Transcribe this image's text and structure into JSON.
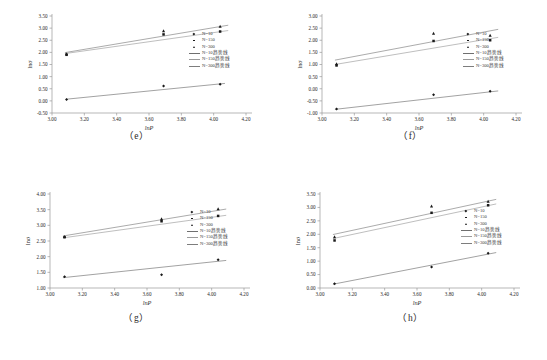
{
  "figure": {
    "background": "#ffffff",
    "axis_color": "#8c8c8c",
    "text_color": "#2b2b2b"
  },
  "legend": {
    "items": [
      {
        "label": "N=10",
        "type": "marker",
        "marker": "diamond",
        "color": "#1a1a1a"
      },
      {
        "label": "N=150",
        "type": "marker",
        "marker": "square",
        "color": "#1a1a1a"
      },
      {
        "label": "N=300",
        "type": "marker",
        "marker": "triangle",
        "color": "#1a1a1a"
      },
      {
        "label": "N=10趋势线",
        "type": "line",
        "color": "#6f6f6f"
      },
      {
        "label": "N=150趋势线",
        "type": "line",
        "color": "#9a9a9a"
      },
      {
        "label": "N=300趋势线",
        "type": "line",
        "color": "#7d7d7d"
      }
    ]
  },
  "chart_data": [
    {
      "id": "e",
      "caption": "（e）",
      "type": "scatter",
      "title": "",
      "xlabel": "lnP",
      "ylabel": "lnσ",
      "xlim": [
        3.0,
        4.2
      ],
      "ylim": [
        -0.5,
        3.5
      ],
      "xticks": [
        "3.00",
        "3.20",
        "3.40",
        "3.60",
        "3.80",
        "4.00",
        "4.20"
      ],
      "yticks": [
        "-0.50",
        "0.00",
        "0.50",
        "1.00",
        "1.50",
        "2.00",
        "2.50",
        "3.00",
        "3.50"
      ],
      "grid": false,
      "legend_position": "right",
      "x": [
        3.09,
        3.69,
        4.04
      ],
      "series": [
        {
          "name": "N=10",
          "marker": "diamond",
          "values": [
            0.06,
            0.61,
            0.69
          ]
        },
        {
          "name": "N=150",
          "marker": "square",
          "values": [
            1.9,
            2.74,
            2.86
          ]
        },
        {
          "name": "N=300",
          "marker": "triangle",
          "values": [
            1.93,
            2.88,
            3.07
          ]
        }
      ],
      "trendlines": [
        {
          "name": "N=10趋势线",
          "color": "#6f6f6f",
          "x0": 3.09,
          "y0": 0.07,
          "x1": 4.07,
          "y1": 0.72
        },
        {
          "name": "N=150趋势线",
          "color": "#9a9a9a",
          "x0": 3.08,
          "y0": 1.95,
          "x1": 4.09,
          "y1": 2.9
        },
        {
          "name": "N=300趋势线",
          "color": "#7d7d7d",
          "x0": 3.08,
          "y0": 1.99,
          "x1": 4.09,
          "y1": 3.12
        }
      ]
    },
    {
      "id": "f",
      "caption": "（f）",
      "type": "scatter",
      "title": "",
      "xlabel": "lnP",
      "ylabel": "lnσ",
      "xlim": [
        3.0,
        4.2
      ],
      "ylim": [
        -1.0,
        3.0
      ],
      "xticks": [
        "3.00",
        "3.20",
        "3.40",
        "3.60",
        "3.80",
        "4.00",
        "4.20"
      ],
      "yticks": [
        "-1.00",
        "-0.50",
        "0.00",
        "0.50",
        "1.00",
        "1.50",
        "2.00",
        "2.50",
        "3.00"
      ],
      "grid": false,
      "legend_position": "right",
      "x": [
        3.09,
        3.69,
        4.04
      ],
      "series": [
        {
          "name": "N=10",
          "marker": "diamond",
          "values": [
            -0.84,
            -0.25,
            -0.1
          ]
        },
        {
          "name": "N=150",
          "marker": "square",
          "values": [
            0.96,
            1.97,
            2.0
          ]
        },
        {
          "name": "N=300",
          "marker": "triangle",
          "values": [
            1.02,
            2.28,
            2.2
          ]
        }
      ],
      "trendlines": [
        {
          "name": "N=10趋势线",
          "color": "#6f6f6f",
          "x0": 3.08,
          "y0": -0.85,
          "x1": 4.09,
          "y1": -0.09
        },
        {
          "name": "N=150趋势线",
          "color": "#9a9a9a",
          "x0": 3.08,
          "y0": 1.0,
          "x1": 4.09,
          "y1": 2.12
        },
        {
          "name": "N=300趋势线",
          "color": "#7d7d7d",
          "x0": 3.08,
          "y0": 1.18,
          "x1": 4.09,
          "y1": 2.45
        }
      ]
    },
    {
      "id": "g",
      "caption": "（g）",
      "type": "scatter",
      "title": "",
      "xlabel": "lnP",
      "ylabel": "lnσ",
      "xlim": [
        3.0,
        4.2
      ],
      "ylim": [
        1.0,
        4.0
      ],
      "xticks": [
        "3.00",
        "3.20",
        "3.40",
        "3.60",
        "3.80",
        "4.00",
        "4.20"
      ],
      "yticks": [
        "1.00",
        "1.50",
        "2.00",
        "2.50",
        "3.00",
        "3.50",
        "4.00"
      ],
      "grid": false,
      "legend_position": "right",
      "x": [
        3.09,
        3.69,
        4.04
      ],
      "series": [
        {
          "name": "N=10",
          "marker": "diamond",
          "values": [
            1.36,
            1.42,
            1.9
          ]
        },
        {
          "name": "N=150",
          "marker": "square",
          "values": [
            2.62,
            3.13,
            3.3
          ]
        },
        {
          "name": "N=300",
          "marker": "triangle",
          "values": [
            2.64,
            3.2,
            3.52
          ]
        }
      ],
      "trendlines": [
        {
          "name": "N=10趋势线",
          "color": "#6f6f6f",
          "x0": 3.08,
          "y0": 1.33,
          "x1": 4.09,
          "y1": 1.88
        },
        {
          "name": "N=150趋势线",
          "color": "#9a9a9a",
          "x0": 3.08,
          "y0": 2.6,
          "x1": 4.09,
          "y1": 3.32
        },
        {
          "name": "N=300趋势线",
          "color": "#7d7d7d",
          "x0": 3.08,
          "y0": 2.66,
          "x1": 4.09,
          "y1": 3.52
        }
      ]
    },
    {
      "id": "h",
      "caption": "（h）",
      "type": "scatter",
      "title": "",
      "xlabel": "lnP",
      "ylabel": "lnσ",
      "xlim": [
        3.0,
        4.2
      ],
      "ylim": [
        0.0,
        3.5
      ],
      "xticks": [
        "3.00",
        "3.20",
        "3.40",
        "3.60",
        "3.80",
        "4.00",
        "4.20"
      ],
      "yticks": [
        "0.00",
        "0.50",
        "1.00",
        "1.50",
        "2.00",
        "2.50",
        "3.00",
        "3.50"
      ],
      "grid": false,
      "legend_position": "right",
      "x": [
        3.09,
        3.69,
        4.04
      ],
      "series": [
        {
          "name": "N=10",
          "marker": "diamond",
          "values": [
            0.16,
            0.78,
            1.29
          ]
        },
        {
          "name": "N=150",
          "marker": "square",
          "values": [
            1.77,
            2.8,
            3.08
          ]
        },
        {
          "name": "N=300",
          "marker": "triangle",
          "values": [
            1.9,
            3.05,
            3.22
          ]
        }
      ],
      "trendlines": [
        {
          "name": "N=10趋势线",
          "color": "#6f6f6f",
          "x0": 3.08,
          "y0": 0.14,
          "x1": 4.09,
          "y1": 1.32
        },
        {
          "name": "N=150趋势线",
          "color": "#9a9a9a",
          "x0": 3.08,
          "y0": 1.84,
          "x1": 4.09,
          "y1": 3.13
        },
        {
          "name": "N=300趋势线",
          "color": "#7d7d7d",
          "x0": 3.08,
          "y0": 1.99,
          "x1": 4.09,
          "y1": 3.3
        }
      ]
    }
  ]
}
